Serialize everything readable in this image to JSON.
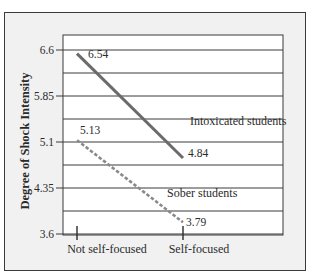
{
  "chart_data": {
    "type": "line",
    "title": "",
    "xlabel": "",
    "ylabel": "Degree of Shock Intensity",
    "categories": [
      "Not self-focused",
      "Self-focused"
    ],
    "yticks": [
      "6.6",
      "5.85",
      "5.1",
      "4.35",
      "3.6"
    ],
    "ylim": [
      3.6,
      6.6
    ],
    "grid": true,
    "legend": "inline labels",
    "series": [
      {
        "name": "Intoxicated students",
        "values": [
          6.54,
          4.84
        ],
        "value_labels": [
          "6.54",
          "4.84"
        ],
        "style": "solid",
        "color": "#6b6b6b"
      },
      {
        "name": "Sober students",
        "values": [
          5.13,
          3.79
        ],
        "value_labels": [
          "5.13",
          "3.79"
        ],
        "style": "dashed",
        "color": "#8a8a8a"
      }
    ]
  },
  "colors": {
    "frame_bg": "#f1f1f1",
    "plot_bg": "#ffffff",
    "grid": "#3a3a3a",
    "text": "#2a2a2a"
  }
}
